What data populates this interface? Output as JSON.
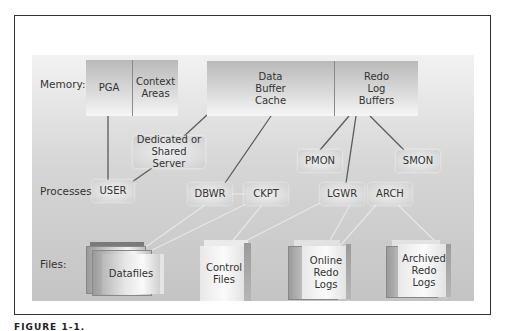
{
  "diagram": {
    "rows": {
      "memory": "Memory:",
      "processes": "Processes:",
      "files": "Files:"
    },
    "memory": {
      "pga": "PGA",
      "context_areas": "Context Areas",
      "data_buffer_cache": "Data Buffer Cache",
      "redo_log_buffers": "Redo Log Buffers"
    },
    "processes": {
      "server": "Dedicated or Shared Server",
      "user": "USER",
      "dbwr": "DBWR",
      "ckpt": "CKPT",
      "pmon": "PMON",
      "smon": "SMON",
      "lgwr": "LGWR",
      "arch": "ARCH"
    },
    "files": {
      "datafiles": "Datafiles",
      "control_files": "Control Files",
      "online_redo_logs": "Online Redo Logs",
      "archived_redo_logs": "Archived Redo Logs"
    },
    "connections": [
      [
        "PGA",
        "USER"
      ],
      [
        "Dedicated or Shared Server",
        "USER"
      ],
      [
        "Data Buffer Cache",
        "Dedicated or Shared Server"
      ],
      [
        "Data Buffer Cache",
        "DBWR"
      ],
      [
        "Redo Log Buffers",
        "PMON"
      ],
      [
        "Redo Log Buffers",
        "LGWR"
      ],
      [
        "Redo Log Buffers",
        "SMON"
      ],
      [
        "DBWR",
        "CKPT"
      ],
      [
        "DBWR",
        "Datafiles"
      ],
      [
        "CKPT",
        "Datafiles"
      ],
      [
        "CKPT",
        "Control Files"
      ],
      [
        "LGWR",
        "Control Files"
      ],
      [
        "LGWR",
        "Online Redo Logs"
      ],
      [
        "ARCH",
        "Online Redo Logs"
      ],
      [
        "ARCH",
        "Archived Redo Logs"
      ]
    ]
  },
  "caption": "FIGURE 1-1."
}
